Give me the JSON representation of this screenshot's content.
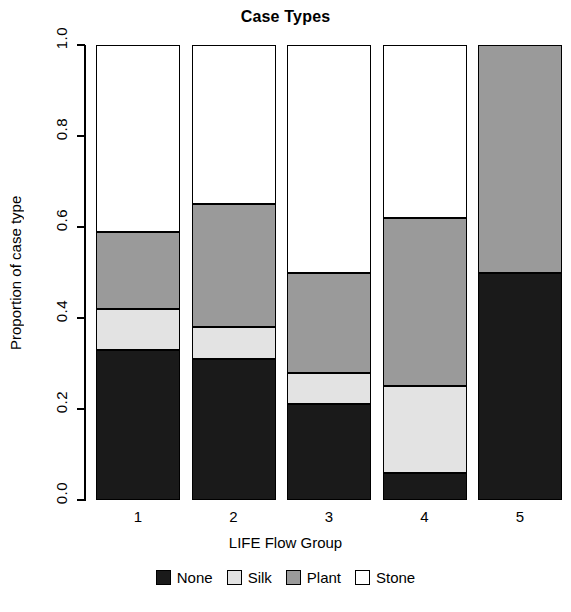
{
  "chart_data": {
    "type": "bar",
    "subtype": "stacked-proportional",
    "title": "Case Types",
    "xlabel": "LIFE Flow Group",
    "ylabel": "Proportion of case type",
    "categories": [
      "1",
      "2",
      "3",
      "4",
      "5"
    ],
    "ylim": [
      0.0,
      1.0
    ],
    "ytick_labels": [
      "0.0",
      "0.2",
      "0.4",
      "0.6",
      "0.8",
      "1.0"
    ],
    "ytick_values": [
      0.0,
      0.2,
      0.4,
      0.6,
      0.8,
      1.0
    ],
    "grid": false,
    "legend_position": "bottom",
    "stack_order_bottom_to_top": [
      "None",
      "Silk",
      "Plant",
      "Stone"
    ],
    "series": [
      {
        "name": "None",
        "color": "#1a1a1a",
        "values": [
          0.33,
          0.31,
          0.21,
          0.06,
          0.5
        ]
      },
      {
        "name": "Silk",
        "color": "#e3e3e3",
        "values": [
          0.09,
          0.07,
          0.07,
          0.19,
          0.0
        ]
      },
      {
        "name": "Plant",
        "color": "#9a9a9a",
        "values": [
          0.17,
          0.27,
          0.22,
          0.37,
          0.5
        ]
      },
      {
        "name": "Stone",
        "color": "#ffffff",
        "values": [
          0.41,
          0.35,
          0.5,
          0.38,
          0.0
        ]
      }
    ],
    "cumulative_boundaries": [
      [
        0.33,
        0.42,
        0.59,
        1.0
      ],
      [
        0.31,
        0.38,
        0.65,
        1.0
      ],
      [
        0.21,
        0.28,
        0.5,
        1.0
      ],
      [
        0.06,
        0.25,
        0.62,
        1.0
      ],
      [
        0.5,
        0.5,
        1.0,
        1.0
      ]
    ]
  },
  "legend": {
    "items": [
      {
        "label": "None",
        "color": "#1a1a1a"
      },
      {
        "label": "Silk",
        "color": "#e3e3e3"
      },
      {
        "label": "Plant",
        "color": "#9a9a9a"
      },
      {
        "label": "Stone",
        "color": "#ffffff"
      }
    ]
  }
}
